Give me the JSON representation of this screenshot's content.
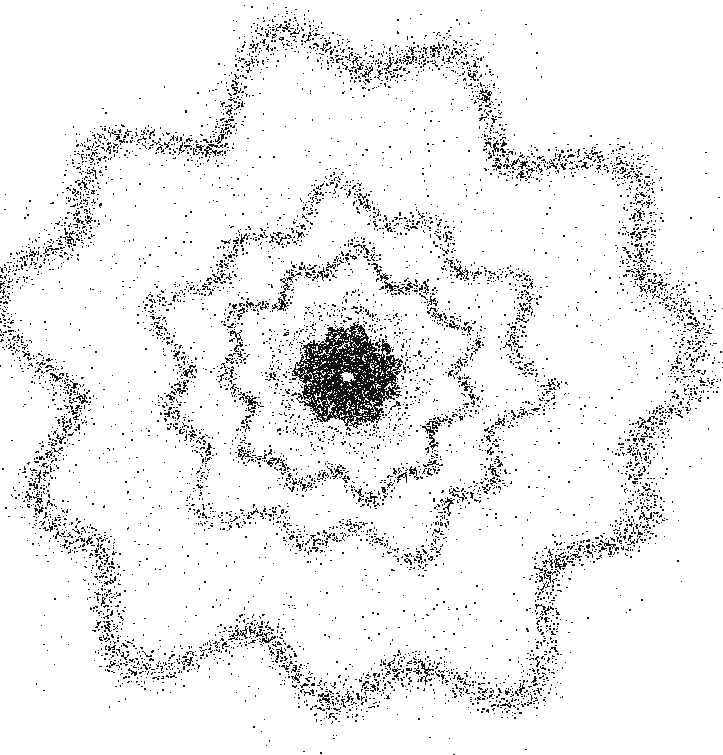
{
  "figure": {
    "title": "",
    "background_color": "#ffffff",
    "dot_color": "#111111",
    "width": 723,
    "height": 755
  },
  "chart_data": {
    "type": "scatter",
    "title": "",
    "subtitle": "",
    "xlabel": "",
    "ylabel": "",
    "xlim": [
      0,
      723
    ],
    "ylim": [
      0,
      755
    ],
    "grid": false,
    "legend": false,
    "axes_visible": false,
    "tick_labels_x": [],
    "tick_labels_y": [],
    "annotations": [],
    "center": {
      "x": 347,
      "y": 376
    },
    "marker": {
      "shape": "dot",
      "color": "#111111",
      "size_min_px": 1,
      "size_max_px": 3
    },
    "series": [
      {
        "name": "central-void",
        "kind": "void",
        "radius_inner": 0,
        "radius_outer": 5,
        "count": 0,
        "density": 0.0,
        "dot_size": 0,
        "ellipse_x": 1.0,
        "ellipse_y": 1.0,
        "jitter": 0
      },
      {
        "name": "core-blob",
        "kind": "annulus",
        "radius_inner": 6,
        "radius_outer": 48,
        "count": 5200,
        "density": 1.0,
        "dot_size": 2,
        "ellipse_x": 1.06,
        "ellipse_y": 1.0,
        "jitter": 4
      },
      {
        "name": "core-fringe",
        "kind": "annulus",
        "radius_inner": 45,
        "radius_outer": 78,
        "count": 1400,
        "density": 0.55,
        "dot_size": 2,
        "ellipse_x": 1.05,
        "ellipse_y": 1.0,
        "jitter": 7
      },
      {
        "name": "inner-ring",
        "kind": "ring",
        "radius_inner": 100,
        "radius_outer": 124,
        "count": 2600,
        "density": 0.9,
        "dot_size": 2,
        "ellipse_x": 1.04,
        "ellipse_y": 1.0,
        "jitter": 6
      },
      {
        "name": "mid-ring",
        "kind": "ring",
        "radius_inner": 152,
        "radius_outer": 186,
        "count": 3400,
        "density": 0.9,
        "dot_size": 2,
        "ellipse_x": 1.05,
        "ellipse_y": 1.0,
        "jitter": 8
      },
      {
        "name": "outer-ring",
        "kind": "ring",
        "radius_inner": 288,
        "radius_outer": 340,
        "count": 9000,
        "density": 1.0,
        "dot_size": 2,
        "ellipse_x": 1.02,
        "ellipse_y": 1.0,
        "jitter": 14
      },
      {
        "name": "halo-scatter",
        "kind": "annulus",
        "radius_inner": 20,
        "radius_outer": 348,
        "count": 4200,
        "density": 0.35,
        "dot_size": 2,
        "ellipse_x": 1.02,
        "ellipse_y": 1.0,
        "jitter": 0
      },
      {
        "name": "outer-halo-fade",
        "kind": "annulus",
        "radius_inner": 338,
        "radius_outer": 382,
        "count": 900,
        "density": 0.18,
        "dot_size": 2,
        "ellipse_x": 1.02,
        "ellipse_y": 1.0,
        "jitter": 0
      }
    ]
  }
}
